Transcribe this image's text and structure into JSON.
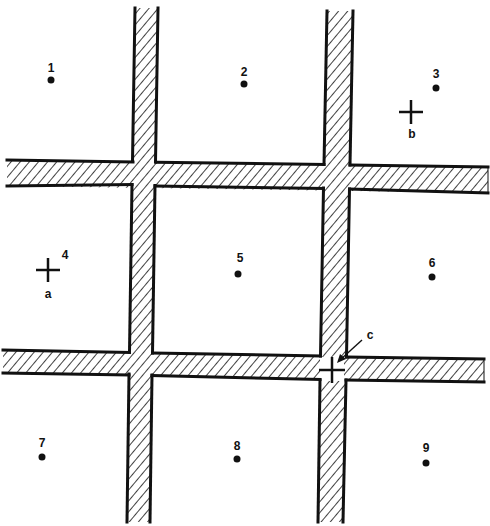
{
  "diagram": {
    "colors": {
      "background": "#ffffff",
      "ink": "#111111",
      "road_fill": "#ffffff",
      "hatch": "#111111"
    },
    "roads": [
      {
        "id": "vertical-road-left",
        "orientation": "vertical"
      },
      {
        "id": "vertical-road-right",
        "orientation": "vertical"
      },
      {
        "id": "horizontal-road-top",
        "orientation": "horizontal"
      },
      {
        "id": "horizontal-road-bottom",
        "orientation": "horizontal"
      }
    ],
    "points": [
      {
        "label": "1",
        "x": 51,
        "y": 80,
        "lx": 51,
        "ly": 72
      },
      {
        "label": "2",
        "x": 244,
        "y": 84,
        "lx": 244,
        "ly": 76
      },
      {
        "label": "3",
        "x": 436,
        "y": 88,
        "lx": 436,
        "ly": 78
      },
      {
        "label": "4",
        "x": null,
        "y": null,
        "lx": 65,
        "ly": 259
      },
      {
        "label": "5",
        "x": 238,
        "y": 274,
        "lx": 240,
        "ly": 262
      },
      {
        "label": "6",
        "x": 432,
        "y": 277,
        "lx": 432,
        "ly": 267
      },
      {
        "label": "7",
        "x": 42,
        "y": 457,
        "lx": 42,
        "ly": 447
      },
      {
        "label": "8",
        "x": 237,
        "y": 459,
        "lx": 237,
        "ly": 450
      },
      {
        "label": "9",
        "x": 426,
        "y": 463,
        "lx": 426,
        "ly": 452
      }
    ],
    "markers": [
      {
        "label": "a",
        "x": 48,
        "y": 270,
        "lx": 48,
        "ly": 298
      },
      {
        "label": "b",
        "x": 411,
        "y": 112,
        "lx": 412,
        "ly": 138
      },
      {
        "label": "c",
        "x": 332,
        "y": 370,
        "lx": 370,
        "ly": 339
      }
    ]
  }
}
